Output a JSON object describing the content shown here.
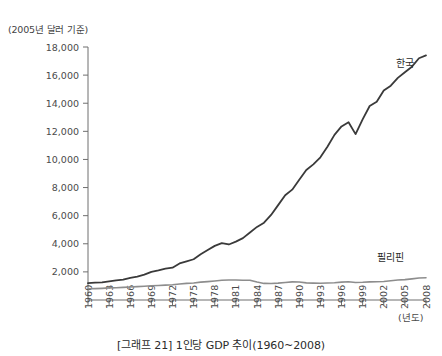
{
  "unit_note": "(2005년 달러 기준)",
  "caption": "[그래프 21] 1인당 GDP 추이(1960~2008)",
  "x_axis_unit": "(년도)",
  "chart_data": {
    "type": "line",
    "title": "[그래프 21] 1인당 GDP 추이(1960~2008)",
    "subtitle": "(2005년 달러 기준)",
    "xlabel": "(년도)",
    "ylabel": "",
    "xlim": [
      1960,
      2008
    ],
    "ylim": [
      0,
      18000
    ],
    "ytick_labels": [
      "2,000",
      "4,000",
      "6,000",
      "8,000",
      "10,000",
      "12,000",
      "14,000",
      "16,000",
      "18,000"
    ],
    "ytick_values": [
      2000,
      4000,
      6000,
      8000,
      10000,
      12000,
      14000,
      16000,
      18000
    ],
    "xtick_labels": [
      "1960",
      "1963",
      "1966",
      "1969",
      "1972",
      "1975",
      "1978",
      "1981",
      "1984",
      "1987",
      "1990",
      "1993",
      "1996",
      "1999",
      "2002",
      "2005",
      "2008"
    ],
    "xtick_values": [
      1960,
      1963,
      1966,
      1969,
      1972,
      1975,
      1978,
      1981,
      1984,
      1987,
      1990,
      1993,
      1996,
      1999,
      2002,
      2005,
      2008
    ],
    "grid": false,
    "legend_position": "inline-annotation",
    "x": [
      1960,
      1961,
      1962,
      1963,
      1964,
      1965,
      1966,
      1967,
      1968,
      1969,
      1970,
      1971,
      1972,
      1973,
      1974,
      1975,
      1976,
      1977,
      1978,
      1979,
      1980,
      1981,
      1982,
      1983,
      1984,
      1985,
      1986,
      1987,
      1988,
      1989,
      1990,
      1991,
      1992,
      1993,
      1994,
      1995,
      1996,
      1997,
      1998,
      1999,
      2000,
      2001,
      2002,
      2003,
      2004,
      2005,
      2006,
      2007,
      2008
    ],
    "series": [
      {
        "name": "한국",
        "color": "#3a3a3a",
        "label_x": 2005,
        "label_y": 16600,
        "values": [
          1200,
          1230,
          1250,
          1320,
          1400,
          1450,
          1580,
          1660,
          1800,
          2000,
          2100,
          2230,
          2300,
          2600,
          2750,
          2900,
          3250,
          3550,
          3850,
          4050,
          3950,
          4150,
          4400,
          4800,
          5200,
          5500,
          6050,
          6750,
          7450,
          7850,
          8550,
          9250,
          9650,
          10150,
          10900,
          11750,
          12350,
          12650,
          11800,
          12850,
          13800,
          14100,
          14900,
          15250,
          15800,
          16200,
          16600,
          17200,
          17400
        ]
      },
      {
        "name": "필리핀",
        "color": "#8d8d8d",
        "label_x": 2003,
        "label_y": 2800,
        "values": [
          800,
          810,
          830,
          860,
          870,
          900,
          920,
          950,
          980,
          1010,
          1030,
          1060,
          1080,
          1140,
          1180,
          1210,
          1270,
          1310,
          1350,
          1400,
          1420,
          1420,
          1410,
          1410,
          1280,
          1180,
          1170,
          1200,
          1250,
          1290,
          1280,
          1220,
          1200,
          1190,
          1210,
          1230,
          1270,
          1300,
          1250,
          1260,
          1290,
          1300,
          1320,
          1370,
          1420,
          1450,
          1500,
          1560,
          1580
        ]
      }
    ]
  }
}
